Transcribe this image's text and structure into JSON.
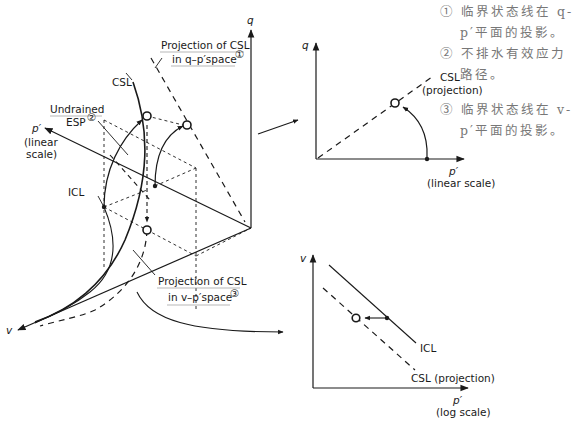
{
  "diagram": {
    "type": "critical-state-3d-with-projections",
    "main_3d": {
      "axes": {
        "q": "q",
        "p": "p′",
        "p_sub": [
          "(linear",
          "scale)"
        ],
        "v": "v"
      },
      "labels": {
        "csl": "CSL",
        "icl": "ICL",
        "undrained": "Undrained",
        "esp": "ESP",
        "esp_sup": "②",
        "proj_q_line1": "Projection of CSL",
        "proj_q_line2": "in q–p′space",
        "proj_q_sup": "①",
        "proj_v_line1": "Projection of CSL",
        "proj_v_line2": "in v–p′space",
        "proj_v_sup": "③"
      }
    },
    "q_p_plot": {
      "y_axis": "q",
      "x_axis": "p′",
      "x_sub": "(linear scale)",
      "csl_line1": "CSL",
      "csl_line2": "(projection)"
    },
    "v_p_plot": {
      "y_axis": "v",
      "x_axis": "p′",
      "x_sub": "(log scale)",
      "icl": "ICL",
      "csl": "CSL (projection)"
    },
    "notes": {
      "n1a": "① 临界状态线在 q-",
      "n1b": "p′平面的投影。",
      "n2a": "② 不排水有效应力",
      "n2b": "路径。",
      "n3a": "③ 临界状态线在 v-",
      "n3b": "p′平面的投影。"
    }
  }
}
